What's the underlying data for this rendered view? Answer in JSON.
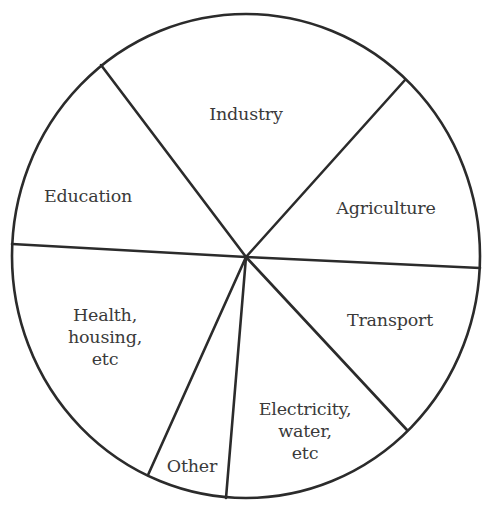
{
  "chart_data": {
    "type": "pie",
    "title": "",
    "categories": [
      "Industry",
      "Agriculture",
      "Transport",
      "Electricity, water, etc",
      "Other",
      "Health, housing, etc",
      "Education"
    ],
    "values": [
      22,
      14,
      12,
      13,
      5,
      19,
      14
    ],
    "unit": "approx % of total (estimated from slice angles; no values shown)",
    "legend": "none (labels inside slices)",
    "grid": false,
    "colors": {
      "fill": "#ffffff",
      "stroke": "#2b2b2b",
      "text": "#3a3a3a"
    }
  },
  "geometry": {
    "center": [
      246,
      257
    ],
    "rx": 234,
    "ry": 242,
    "spokes": [
      {
        "name": "education-industry-divider",
        "x": 101,
        "y": 65
      },
      {
        "name": "industry-agriculture-divider",
        "x": 405,
        "y": 80
      },
      {
        "name": "agriculture-transport-divider",
        "x": 480,
        "y": 268
      },
      {
        "name": "transport-electricity-divider",
        "x": 407,
        "y": 430
      },
      {
        "name": "electricity-other-divider",
        "x": 226,
        "y": 498
      },
      {
        "name": "other-health-divider",
        "x": 148,
        "y": 475
      },
      {
        "name": "health-education-divider",
        "x": 12,
        "y": 244
      }
    ]
  },
  "labels": [
    {
      "id": "industry",
      "text": "Industry",
      "x": 246,
      "y": 114
    },
    {
      "id": "agriculture",
      "text": "Agriculture",
      "x": 386,
      "y": 208
    },
    {
      "id": "education",
      "text": "Education",
      "x": 88,
      "y": 196
    },
    {
      "id": "transport",
      "text": "Transport",
      "x": 390,
      "y": 320
    },
    {
      "id": "health",
      "text": "Health,\nhousing,\netc",
      "x": 105,
      "y": 337
    },
    {
      "id": "electricity",
      "text": "Electricity,\nwater,\netc",
      "x": 305,
      "y": 431
    },
    {
      "id": "other",
      "text": "Other",
      "x": 192,
      "y": 466
    }
  ]
}
